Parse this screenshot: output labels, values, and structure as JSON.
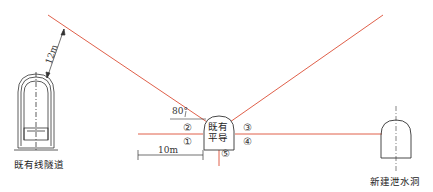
{
  "labels": {
    "existing_tunnel": "既有线隧道",
    "new_drainage": "新建泄水洞",
    "pilot_top": "既有",
    "pilot_bottom": "平导",
    "dist_12m": "12m",
    "dist_10m": "10m",
    "angle": "80°"
  },
  "markers": [
    "①",
    "②",
    "③",
    "④",
    "⑤"
  ],
  "colors": {
    "line_red": "#e0604a",
    "line_black": "#333333"
  }
}
